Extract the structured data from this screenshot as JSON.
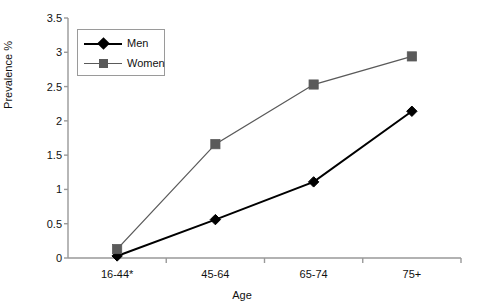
{
  "chart_data": {
    "type": "line",
    "title": "",
    "xlabel": "Age",
    "ylabel": "Prevalence %",
    "categories": [
      "16-44*",
      "45-64",
      "65-74",
      "75+"
    ],
    "series": [
      {
        "name": "Men",
        "values": [
          0.03,
          0.56,
          1.11,
          2.14
        ],
        "color": "#000000",
        "marker": "diamond"
      },
      {
        "name": "Women",
        "values": [
          0.13,
          1.66,
          2.53,
          2.94
        ],
        "color": "#5a5a5a",
        "marker": "square"
      }
    ],
    "ylim": [
      0,
      3.5
    ],
    "yticks": [
      "0",
      "0.5",
      "1",
      "1.5",
      "2",
      "2.5",
      "3",
      "3.5"
    ],
    "ytick_values": [
      0,
      0.5,
      1,
      1.5,
      2,
      2.5,
      3,
      3.5
    ],
    "grid": false,
    "legend_position": "upper-left-inside",
    "legend_entries": [
      "Men",
      "Women"
    ],
    "axis_color": "#999999",
    "background": "#ffffff"
  }
}
